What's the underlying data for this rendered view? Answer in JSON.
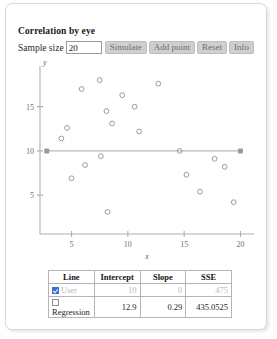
{
  "app": {
    "title": "Correlation by eye"
  },
  "toolbar": {
    "sample_size_label": "Sample size",
    "sample_size_value": "20",
    "sample_size_placeholder": "20",
    "simulate_label": "Simulate",
    "add_point_label": "Add point",
    "reset_label": "Reset",
    "info_label": "Info"
  },
  "chart_data": {
    "type": "scatter",
    "title": "",
    "xlabel": "x",
    "ylabel": "y",
    "xlim": [
      2.2,
      21.2
    ],
    "ylim": [
      0.6,
      19.6
    ],
    "xticks": [
      "5",
      "10",
      "15",
      "20"
    ],
    "xtick_values": [
      5,
      10,
      15,
      20
    ],
    "yticks": [
      "5",
      "10",
      "15"
    ],
    "ytick_values": [
      5,
      10,
      15
    ],
    "grid": false,
    "legend": "none",
    "points": [
      {
        "x": 4.1,
        "y": 11.4
      },
      {
        "x": 4.6,
        "y": 12.6
      },
      {
        "x": 5.0,
        "y": 6.9
      },
      {
        "x": 5.9,
        "y": 17.0
      },
      {
        "x": 6.2,
        "y": 8.4
      },
      {
        "x": 7.5,
        "y": 18.0
      },
      {
        "x": 7.6,
        "y": 9.4
      },
      {
        "x": 8.1,
        "y": 14.5
      },
      {
        "x": 8.2,
        "y": 3.1
      },
      {
        "x": 8.6,
        "y": 13.1
      },
      {
        "x": 9.5,
        "y": 16.3
      },
      {
        "x": 10.6,
        "y": 15.0
      },
      {
        "x": 11.0,
        "y": 12.2
      },
      {
        "x": 12.7,
        "y": 17.6
      },
      {
        "x": 14.6,
        "y": 10.0
      },
      {
        "x": 15.2,
        "y": 7.3
      },
      {
        "x": 16.4,
        "y": 5.4
      },
      {
        "x": 17.7,
        "y": 9.1
      },
      {
        "x": 18.6,
        "y": 8.2
      },
      {
        "x": 19.4,
        "y": 4.2
      }
    ],
    "user_line": {
      "intercept": 10,
      "slope": 0,
      "x_start": 2.8,
      "x_end": 20.0,
      "handles": [
        {
          "x": 2.8,
          "y": 10
        },
        {
          "x": 20.0,
          "y": 10
        }
      ]
    }
  },
  "table": {
    "headers": [
      "Line",
      "Intercept",
      "Slope",
      "SSE"
    ],
    "rows": [
      {
        "name": "User",
        "checked": true,
        "intercept": "10",
        "slope": "0",
        "sse": "475"
      },
      {
        "name": "Regression",
        "checked": false,
        "intercept": "12.9",
        "slope": "0.29",
        "sse": "435.0525"
      }
    ]
  },
  "colors": {
    "checkbox_accent": "#3a6fd8",
    "button_face": "#cfcfcf",
    "axis": "#b0b0b0",
    "point_stroke": "#9b9b9b"
  }
}
